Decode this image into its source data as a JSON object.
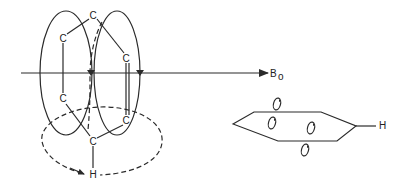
{
  "diagram": {
    "field_label": "B",
    "field_subscript": "o",
    "left_structure": {
      "atoms": [
        {
          "id": "c-top",
          "label": "C"
        },
        {
          "id": "c-upper-left",
          "label": "C"
        },
        {
          "id": "c-upper-right",
          "label": "C"
        },
        {
          "id": "c-lower-left",
          "label": "C"
        },
        {
          "id": "c-lower-right",
          "label": "C"
        },
        {
          "id": "c-bottom",
          "label": "C"
        },
        {
          "id": "h-bottom",
          "label": "H"
        }
      ]
    },
    "right_structure": {
      "hydrogen_label": "H",
      "orbital_symbol_count": 4
    },
    "colors": {
      "line": "#2a2a2a",
      "background": "#ffffff"
    }
  }
}
